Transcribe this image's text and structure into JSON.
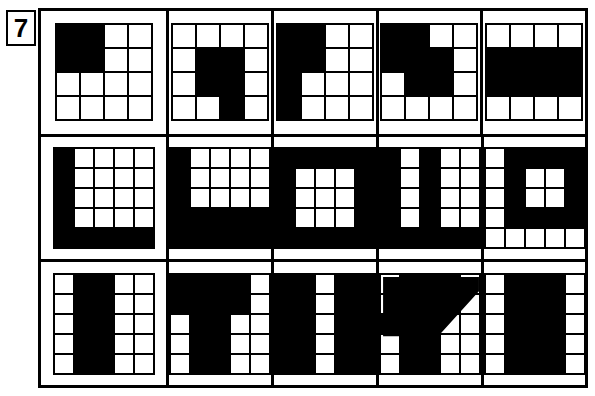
{
  "question": {
    "number": "7"
  },
  "puzzle": {
    "type": "visual-pattern-matrix",
    "rows": [
      {
        "row_label": "row-1",
        "grid_size": 4,
        "question_cell": {
          "name": "row1-question",
          "grid_size": 4,
          "filled": [
            [
              1,
              1
            ],
            [
              1,
              2
            ],
            [
              2,
              1
            ],
            [
              2,
              2
            ]
          ],
          "description": "4x4 grid with top-left 2x2 block black"
        },
        "options": [
          {
            "name": "row1-option-a",
            "grid_size": 4,
            "filled": [
              [
                2,
                2
              ],
              [
                2,
                3
              ],
              [
                3,
                2
              ],
              [
                3,
                3
              ],
              [
                4,
                3
              ]
            ],
            "description": "vertical bar with 2x2 top block"
          },
          {
            "name": "row1-option-b",
            "grid_size": 4,
            "filled": [
              [
                1,
                1
              ],
              [
                1,
                2
              ],
              [
                2,
                1
              ],
              [
                2,
                2
              ],
              [
                3,
                1
              ],
              [
                4,
                1
              ]
            ],
            "description": "2x2 block on top of left column"
          },
          {
            "name": "row1-option-c",
            "grid_size": 4,
            "filled": [
              [
                1,
                1
              ],
              [
                1,
                2
              ],
              [
                2,
                1
              ],
              [
                2,
                2
              ],
              [
                2,
                3
              ],
              [
                3,
                2
              ],
              [
                3,
                3
              ]
            ],
            "description": "stepped zigzag block"
          },
          {
            "name": "row1-option-d",
            "grid_size": 4,
            "filled": [
              [
                2,
                1
              ],
              [
                2,
                2
              ],
              [
                2,
                3
              ],
              [
                2,
                4
              ],
              [
                3,
                1
              ],
              [
                3,
                2
              ],
              [
                3,
                3
              ],
              [
                3,
                4
              ]
            ],
            "description": "middle two rows fully black"
          }
        ]
      },
      {
        "row_label": "row-2",
        "grid_size": 5,
        "question_cell": {
          "name": "row2-question",
          "grid_size": 5,
          "filled": [
            [
              1,
              1
            ],
            [
              2,
              1
            ],
            [
              3,
              1
            ],
            [
              4,
              1
            ],
            [
              5,
              1
            ],
            [
              5,
              2
            ],
            [
              5,
              3
            ],
            [
              5,
              4
            ],
            [
              5,
              5
            ]
          ],
          "description": "L shape: left column and bottom row"
        },
        "options": [
          {
            "name": "row2-option-a",
            "grid_size": 5,
            "filled": [
              [
                1,
                1
              ],
              [
                2,
                1
              ],
              [
                3,
                1
              ],
              [
                4,
                1
              ],
              [
                5,
                1
              ],
              [
                4,
                2
              ],
              [
                4,
                3
              ],
              [
                4,
                4
              ],
              [
                4,
                5
              ],
              [
                5,
                2
              ],
              [
                5,
                3
              ],
              [
                5,
                4
              ],
              [
                5,
                5
              ]
            ],
            "description": "thick L shape with 3x3 white notch top-right"
          },
          {
            "name": "row2-option-b",
            "grid_size": 5,
            "filled": [
              [
                1,
                1
              ],
              [
                1,
                2
              ],
              [
                1,
                3
              ],
              [
                1,
                4
              ],
              [
                1,
                5
              ],
              [
                2,
                1
              ],
              [
                3,
                1
              ],
              [
                4,
                1
              ],
              [
                5,
                1
              ],
              [
                2,
                5
              ],
              [
                3,
                5
              ],
              [
                4,
                5
              ],
              [
                5,
                2
              ],
              [
                5,
                3
              ],
              [
                5,
                4
              ],
              [
                5,
                5
              ]
            ],
            "description": "black ring frame with 3x3 white centre"
          },
          {
            "name": "row2-option-c",
            "grid_size": 5,
            "filled": [
              [
                1,
                1
              ],
              [
                2,
                1
              ],
              [
                3,
                1
              ],
              [
                4,
                1
              ],
              [
                1,
                3
              ],
              [
                2,
                3
              ],
              [
                3,
                3
              ],
              [
                4,
                3
              ],
              [
                5,
                1
              ],
              [
                5,
                2
              ],
              [
                5,
                3
              ],
              [
                5,
                4
              ],
              [
                5,
                5
              ]
            ],
            "description": "two vertical bars joined by bottom row"
          },
          {
            "name": "row2-option-d",
            "grid_size": 5,
            "filled": [
              [
                1,
                2
              ],
              [
                1,
                3
              ],
              [
                1,
                4
              ],
              [
                1,
                5
              ],
              [
                2,
                2
              ],
              [
                2,
                5
              ],
              [
                3,
                2
              ],
              [
                3,
                5
              ],
              [
                4,
                2
              ],
              [
                4,
                3
              ],
              [
                4,
                4
              ],
              [
                4,
                5
              ]
            ],
            "description": "D shape open on left with 2x2 white hole"
          }
        ]
      },
      {
        "row_label": "row-3",
        "grid_size": 5,
        "question_cell": {
          "name": "row3-question",
          "grid_size": 5,
          "filled": [
            [
              1,
              2
            ],
            [
              1,
              3
            ],
            [
              2,
              2
            ],
            [
              2,
              3
            ],
            [
              3,
              2
            ],
            [
              3,
              3
            ],
            [
              4,
              2
            ],
            [
              4,
              3
            ],
            [
              5,
              2
            ],
            [
              5,
              3
            ]
          ],
          "description": "two full black columns (2 and 3)"
        },
        "options": [
          {
            "name": "row3-option-a",
            "grid_size": 5,
            "filled": [
              [
                1,
                1
              ],
              [
                1,
                2
              ],
              [
                1,
                3
              ],
              [
                1,
                4
              ],
              [
                2,
                1
              ],
              [
                2,
                2
              ],
              [
                2,
                3
              ],
              [
                2,
                4
              ],
              [
                3,
                2
              ],
              [
                3,
                3
              ],
              [
                4,
                2
              ],
              [
                4,
                3
              ],
              [
                5,
                2
              ],
              [
                5,
                3
              ]
            ],
            "description": "T shape with wide top bar"
          },
          {
            "name": "row3-option-b",
            "grid_size": 5,
            "filled": [
              [
                1,
                1
              ],
              [
                1,
                2
              ],
              [
                1,
                4
              ],
              [
                1,
                5
              ],
              [
                2,
                1
              ],
              [
                2,
                2
              ],
              [
                2,
                4
              ],
              [
                2,
                5
              ],
              [
                3,
                1
              ],
              [
                3,
                2
              ],
              [
                3,
                4
              ],
              [
                3,
                5
              ],
              [
                4,
                1
              ],
              [
                4,
                2
              ],
              [
                4,
                4
              ],
              [
                4,
                5
              ],
              [
                5,
                1
              ],
              [
                5,
                2
              ],
              [
                5,
                4
              ],
              [
                5,
                5
              ]
            ],
            "description": "all black except white column 3"
          },
          {
            "name": "row3-option-c",
            "grid_size": 5,
            "filled": [
              [
                1,
                2
              ],
              [
                1,
                3
              ],
              [
                1,
                4
              ],
              [
                2,
                2
              ],
              [
                2,
                3
              ],
              [
                2,
                4
              ],
              [
                3,
                1
              ],
              [
                3,
                2
              ],
              [
                3,
                3
              ],
              [
                4,
                2
              ],
              [
                4,
                3
              ],
              [
                5,
                2
              ],
              [
                5,
                3
              ]
            ],
            "description": "diagonal slash with vertical bar"
          },
          {
            "name": "row3-option-d",
            "grid_size": 5,
            "filled": [
              [
                1,
                2
              ],
              [
                1,
                3
              ],
              [
                1,
                4
              ],
              [
                2,
                2
              ],
              [
                2,
                3
              ],
              [
                2,
                4
              ],
              [
                3,
                2
              ],
              [
                3,
                3
              ],
              [
                3,
                4
              ],
              [
                4,
                2
              ],
              [
                4,
                3
              ],
              [
                4,
                4
              ],
              [
                5,
                2
              ],
              [
                5,
                3
              ],
              [
                5,
                4
              ]
            ],
            "description": "three full black columns (2,3,4)"
          }
        ]
      }
    ]
  },
  "colors": {
    "fill": "#000000",
    "empty": "#ffffff",
    "border": "#000000"
  }
}
